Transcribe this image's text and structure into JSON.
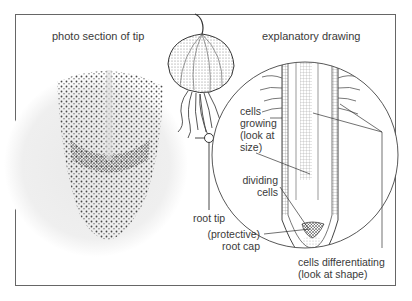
{
  "headings": {
    "left": "photo section of tip",
    "right": "explanatory drawing"
  },
  "labels": {
    "root_tip": "root tip",
    "cells_growing": [
      "cells",
      "growing",
      "(look at",
      "size)"
    ],
    "dividing_cells": [
      "dividing",
      "cells"
    ],
    "root_cap": [
      "(protective)",
      "root cap"
    ],
    "cells_differentiating": [
      "cells differentiating",
      "(look at shape)"
    ]
  }
}
